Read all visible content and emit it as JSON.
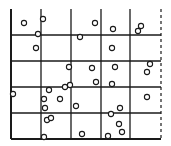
{
  "diagram": {
    "type": "quadrat-grid",
    "colors": {
      "line": "#1a1a1a",
      "circle": "#1a1a1a",
      "background": "#ffffff"
    },
    "grid": {
      "vertical_lines": [
        11,
        41,
        71,
        101,
        130
      ],
      "dashed_right_edge": 161,
      "horizontal_lines": [
        35,
        61,
        87,
        113
      ],
      "top": 9,
      "bottom": 139
    },
    "circle_radius": 2.6,
    "points": [
      [
        24,
        23
      ],
      [
        43,
        19
      ],
      [
        95,
        23
      ],
      [
        113,
        29
      ],
      [
        141,
        26
      ],
      [
        138,
        31
      ],
      [
        38,
        34
      ],
      [
        80,
        37
      ],
      [
        36,
        48
      ],
      [
        112,
        48
      ],
      [
        69,
        67
      ],
      [
        92,
        68
      ],
      [
        115,
        67
      ],
      [
        150,
        64
      ],
      [
        147,
        72
      ],
      [
        49,
        90
      ],
      [
        65,
        87
      ],
      [
        70,
        85
      ],
      [
        96,
        82
      ],
      [
        112,
        84
      ],
      [
        13,
        94
      ],
      [
        44,
        99
      ],
      [
        60,
        99
      ],
      [
        147,
        97
      ],
      [
        45,
        108
      ],
      [
        76,
        106
      ],
      [
        120,
        108
      ],
      [
        111,
        114
      ],
      [
        47,
        120
      ],
      [
        51,
        118
      ],
      [
        119,
        124
      ],
      [
        122,
        132
      ],
      [
        44,
        137
      ],
      [
        82,
        134
      ],
      [
        108,
        136
      ]
    ]
  }
}
